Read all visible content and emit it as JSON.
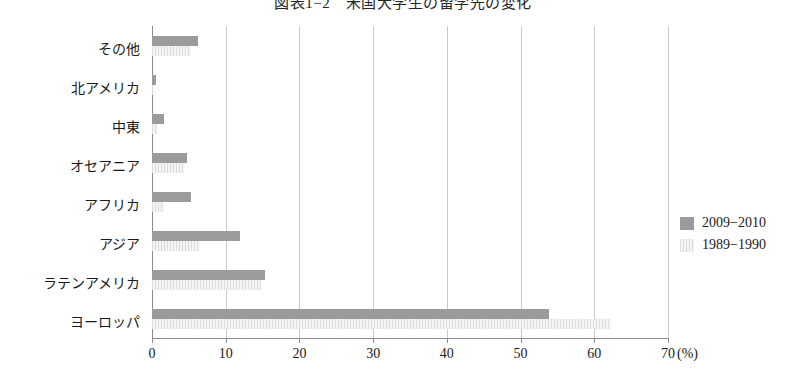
{
  "chart_data": {
    "type": "bar",
    "orientation": "horizontal",
    "title": "図表1−2　米国大学生の留学先の変化",
    "xlabel": "(%)",
    "ylabel": "",
    "xlim": [
      0,
      70
    ],
    "xticks": [
      0,
      10,
      20,
      30,
      40,
      50,
      60,
      70
    ],
    "xtick_labels": [
      "0",
      "10",
      "20",
      "30",
      "40",
      "50",
      "60",
      "70"
    ],
    "x_unit_label": "(%)",
    "grid": true,
    "legend_position": "right",
    "categories": [
      "その他",
      "北アメリカ",
      "中東",
      "オセアニア",
      "アフリカ",
      "アジア",
      "ラテンアメリカ",
      "ヨーロッパ"
    ],
    "series": [
      {
        "name": "2009−2010",
        "color": "#9b9b9b",
        "values": [
          6.3,
          0.6,
          1.6,
          4.8,
          5.3,
          11.9,
          15.3,
          53.8
        ]
      },
      {
        "name": "1989−1990",
        "color": "#ececec",
        "values": [
          5.3,
          0.3,
          0.8,
          4.3,
          1.6,
          6.5,
          14.8,
          62.3
        ]
      }
    ]
  },
  "legend": {
    "items": [
      {
        "label": "2009−2010"
      },
      {
        "label": "1989−1990"
      }
    ]
  }
}
